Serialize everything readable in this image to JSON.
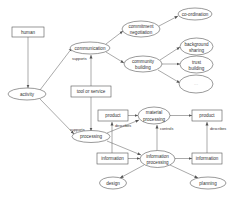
{
  "diagram": {
    "nodes": {
      "human": {
        "label": "human",
        "shape": "box"
      },
      "activity": {
        "label": "activity",
        "shape": "ellipse"
      },
      "communication": {
        "label": "communication",
        "shape": "ellipse"
      },
      "tool_or_service": {
        "label": "tool or service",
        "shape": "box"
      },
      "commitment_negotiation": {
        "line1": "commitment",
        "line2": "negotiation",
        "shape": "ellipse"
      },
      "co_ordination": {
        "label": "co-ordination",
        "shape": "ellipse"
      },
      "community_building": {
        "line1": "community",
        "line2": "building",
        "shape": "ellipse"
      },
      "background_sharing": {
        "line1": "background",
        "line2": "sharing",
        "shape": "ellipse"
      },
      "trust_building": {
        "line1": "trust",
        "line2": "building",
        "shape": "ellipse"
      },
      "more": {
        "label": "...",
        "shape": "ellipse"
      },
      "processing": {
        "label": "processing",
        "shape": "ellipse"
      },
      "product_left": {
        "label": "product",
        "shape": "box"
      },
      "material_processing": {
        "line1": "material",
        "line2": "processing",
        "shape": "ellipse"
      },
      "product_right": {
        "label": "product",
        "shape": "box"
      },
      "information_left": {
        "label": "information",
        "shape": "box"
      },
      "information_processing": {
        "line1": "information",
        "line2": "processing",
        "shape": "ellipse"
      },
      "information_right": {
        "label": "information",
        "shape": "box"
      },
      "design": {
        "label": "design",
        "shape": "ellipse"
      },
      "planning": {
        "label": "planning",
        "shape": "ellipse"
      }
    },
    "edge_labels": {
      "supports_communication": "supports",
      "supports_processing": "supports",
      "describes_left": "describes",
      "controls": "controls",
      "describes_right": "describes"
    }
  }
}
